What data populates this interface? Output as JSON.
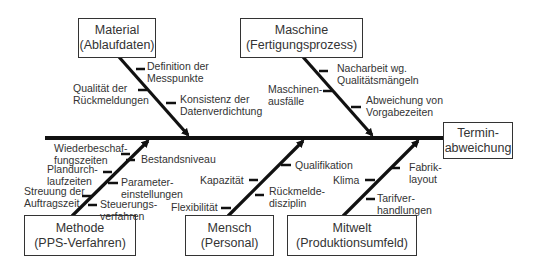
{
  "effect": {
    "line1": "Termin-",
    "line2": "abweichung"
  },
  "categories": {
    "material": {
      "title": "Material",
      "subtitle": "(Ablaufdaten)",
      "causes": [
        {
          "l1": "Definition der",
          "l2": "Messpunkte"
        },
        {
          "l1": "Qualität der",
          "l2": "Rückmeldungen"
        },
        {
          "l1": "Konsistenz der",
          "l2": "Datenverdichtung"
        }
      ]
    },
    "maschine": {
      "title": "Maschine",
      "subtitle": "(Fertigungsprozess)",
      "causes": [
        {
          "l1": "Nacharbeit wg.",
          "l2": "Qualitätsmängeln"
        },
        {
          "l1": "Maschinen-",
          "l2": "ausfälle"
        },
        {
          "l1": "Abweichung von",
          "l2": "Vorgabezeiten"
        }
      ]
    },
    "methode": {
      "title": "Methode",
      "subtitle": "(PPS-Verfahren)",
      "causes": [
        {
          "l1": "Wiederbeschaf-",
          "l2": "fungszeiten"
        },
        {
          "l1": "Bestandsniveau",
          "l2": ""
        },
        {
          "l1": "Plandurch-",
          "l2": "laufzeiten"
        },
        {
          "l1": "Parameter-",
          "l2": "einstellungen"
        },
        {
          "l1": "Streuung der",
          "l2": "Auftragszeit"
        },
        {
          "l1": "Steuerungs-",
          "l2": "verfahren"
        }
      ]
    },
    "mensch": {
      "title": "Mensch",
      "subtitle": "(Personal)",
      "causes": [
        {
          "l1": "Qualifikation",
          "l2": ""
        },
        {
          "l1": "Kapazität",
          "l2": ""
        },
        {
          "l1": "Rückmelde-",
          "l2": "disziplin"
        },
        {
          "l1": "Flexibilität",
          "l2": ""
        }
      ]
    },
    "mitwelt": {
      "title": "Mitwelt",
      "subtitle": "(Produktionsumfeld)",
      "causes": [
        {
          "l1": "Fabrik-",
          "l2": "layout"
        },
        {
          "l1": "Klima",
          "l2": ""
        },
        {
          "l1": "Tarifver-",
          "l2": "handlungen"
        }
      ]
    }
  }
}
